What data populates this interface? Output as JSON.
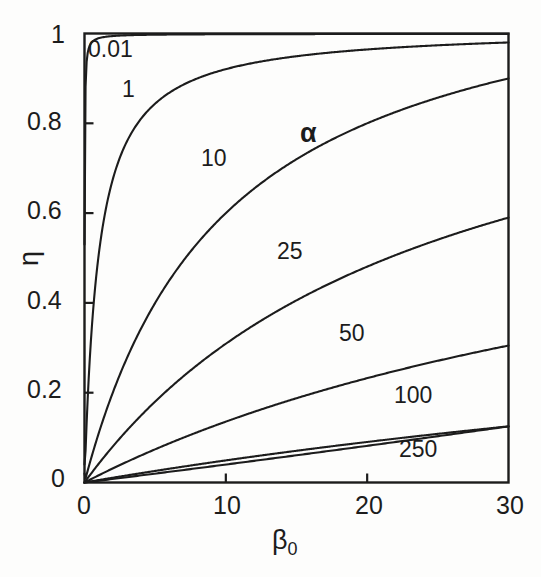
{
  "chart_data": {
    "type": "line",
    "title": "",
    "subtitle": "",
    "xlabel": "β",
    "xlabel_sub": "0",
    "ylabel": "η",
    "xlim": [
      0,
      30
    ],
    "ylim": [
      0,
      1
    ],
    "xticks": [
      0,
      10,
      20,
      30
    ],
    "xtick_labels": [
      "0",
      "10",
      "20",
      "30"
    ],
    "yticks": [
      0,
      0.2,
      0.4,
      0.6,
      0.8,
      1
    ],
    "ytick_labels": [
      "0",
      "0.2",
      "0.4",
      "0.6",
      "0.8",
      "1"
    ],
    "grid": false,
    "legend_position": "inline-curve-labels",
    "legend_symbol": "α",
    "frame": "box",
    "tick_direction": "in",
    "line_color": "#1c1c1c",
    "background_color": "#fdfdfc",
    "series": [
      {
        "name": "0.01",
        "alpha": 0.01,
        "label": "0.01",
        "x": [
          0,
          0.02,
          0.05,
          0.1,
          0.2,
          0.4,
          0.8,
          1.5,
          3,
          6,
          10,
          15,
          20,
          25,
          30
        ],
        "values": [
          0.53,
          0.79,
          0.9,
          0.95,
          0.97,
          0.985,
          0.99,
          0.993,
          0.995,
          0.996,
          0.997,
          0.998,
          0.998,
          0.999,
          0.999
        ]
      },
      {
        "name": "1",
        "alpha": 1,
        "label": "1",
        "x": [
          0,
          0.25,
          0.5,
          1,
          1.5,
          2,
          3,
          4,
          5,
          6,
          8,
          10,
          14,
          18,
          22,
          26,
          30
        ],
        "values": [
          0.04,
          0.23,
          0.37,
          0.54,
          0.63,
          0.7,
          0.78,
          0.83,
          0.86,
          0.88,
          0.91,
          0.93,
          0.95,
          0.96,
          0.97,
          0.974,
          0.98
        ]
      },
      {
        "name": "10",
        "alpha": 10,
        "label": "10",
        "x": [
          0,
          1,
          2,
          3,
          4,
          6,
          8,
          10,
          13,
          16,
          20,
          24,
          27,
          30
        ],
        "values": [
          0.02,
          0.1,
          0.18,
          0.25,
          0.31,
          0.42,
          0.5,
          0.57,
          0.65,
          0.72,
          0.79,
          0.84,
          0.87,
          0.9
        ]
      },
      {
        "name": "25",
        "alpha": 25,
        "label": "25",
        "x": [
          0,
          2,
          4,
          6,
          9,
          12,
          15,
          18,
          21,
          24,
          27,
          30
        ],
        "values": [
          0.01,
          0.08,
          0.14,
          0.2,
          0.28,
          0.35,
          0.41,
          0.46,
          0.5,
          0.54,
          0.565,
          0.59
        ]
      },
      {
        "name": "50",
        "alpha": 50,
        "label": "50",
        "x": [
          0,
          3,
          6,
          10,
          14,
          18,
          22,
          26,
          30
        ],
        "values": [
          0.006,
          0.04,
          0.075,
          0.12,
          0.16,
          0.2,
          0.235,
          0.27,
          0.305
        ]
      },
      {
        "name": "100",
        "alpha": 100,
        "label": "100",
        "x": [
          0,
          5,
          10,
          15,
          20,
          25,
          30
        ],
        "values": [
          0.003,
          0.022,
          0.043,
          0.063,
          0.083,
          0.103,
          0.125
        ]
      },
      {
        "name": "250",
        "alpha": 250,
        "label": "250",
        "x": [
          0,
          10,
          20,
          30
        ],
        "values": [
          0.001,
          0.0,
          0.0,
          0.0
        ]
      }
    ],
    "curve_label_positions": [
      {
        "label": "0.01",
        "x": 1.0,
        "y": 0.955
      },
      {
        "label": "1",
        "x": 2.6,
        "y": 0.855
      },
      {
        "label": "10",
        "x": 8.5,
        "y": 0.665
      },
      {
        "label": "25",
        "x": 14.0,
        "y": 0.468
      },
      {
        "label": "50",
        "x": 20.2,
        "y": 0.3
      },
      {
        "label": "100",
        "x": 23.5,
        "y": 0.172
      },
      {
        "label": "250",
        "x": 24.0,
        "y": 0.062
      }
    ],
    "legend_symbol_position": {
      "x": 15.8,
      "y": 0.765
    }
  }
}
